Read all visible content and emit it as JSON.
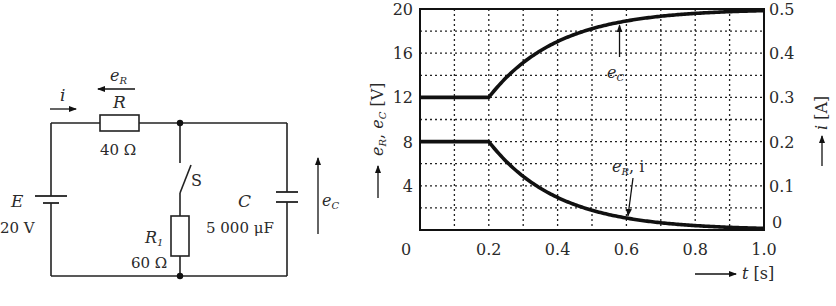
{
  "circuit": {
    "source": {
      "symbol": "E",
      "value": "20 V"
    },
    "resistor_R": {
      "symbol": "R",
      "value": "40 Ω"
    },
    "resistor_R1": {
      "symbol": "R",
      "subscript": "1",
      "value": "60 Ω"
    },
    "capacitor": {
      "symbol": "C",
      "value": "5 000 μF"
    },
    "switch": {
      "symbol": "S"
    },
    "current_label": "i",
    "voltage_R_label": {
      "base": "e",
      "sub": "R"
    },
    "voltage_C_label": {
      "base": "e",
      "sub": "C"
    }
  },
  "chart_data": {
    "type": "line",
    "title": "",
    "xlabel": "t [s]",
    "ylabel": "e_R, e_C [V]",
    "ylabel_right": "i [A]",
    "xlim": [
      0,
      1.0
    ],
    "ylim": [
      0,
      20
    ],
    "ylim_right": [
      0,
      0.5
    ],
    "grid": true,
    "grid_style": "dotted",
    "x_ticks": [
      "0",
      "0.2",
      "0.4",
      "0.6",
      "0.8",
      "1.0"
    ],
    "y_ticks": [
      "0",
      "4",
      "8",
      "12",
      "16",
      "20"
    ],
    "y_ticks_right": [
      "0",
      "0.1",
      "0.2",
      "0.3",
      "0.4",
      "0.5"
    ],
    "x": [
      0,
      0.1,
      0.2,
      0.25,
      0.3,
      0.35,
      0.4,
      0.5,
      0.6,
      0.7,
      0.8,
      0.9,
      1.0
    ],
    "series": [
      {
        "name": "e_C",
        "values": [
          12,
          12,
          12,
          13.8,
          15.2,
          16.2,
          17.1,
          18.2,
          18.9,
          19.3,
          19.6,
          19.8,
          19.9
        ]
      },
      {
        "name": "e_R, i",
        "values": [
          8,
          8,
          8,
          6.2,
          4.8,
          3.8,
          2.9,
          1.8,
          1.1,
          0.7,
          0.4,
          0.2,
          0.1
        ]
      }
    ],
    "annotations": [
      {
        "text": "e_C",
        "points_to": {
          "x": 0.58,
          "y": 18.7
        }
      },
      {
        "text": "e_R, i",
        "points_to": {
          "x": 0.6,
          "y": 1.2
        }
      }
    ]
  },
  "labels": {
    "x_axis": {
      "var": "t",
      "unit": "[s]"
    },
    "y_axis_left": {
      "unit": "[V]"
    },
    "y_axis_right": {
      "var": "i",
      "unit": "[A]"
    },
    "annot_ec": {
      "base": "e",
      "sub": "C"
    },
    "annot_er": {
      "base": "e",
      "sub": "R",
      "tail": ", i"
    }
  }
}
